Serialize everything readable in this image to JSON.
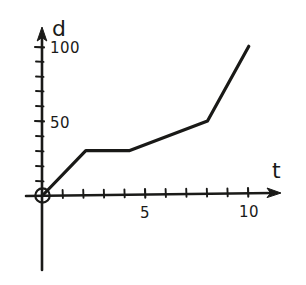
{
  "chart_data": {
    "type": "line",
    "title": "",
    "subtitle": "",
    "xlabel": "t",
    "ylabel": "d",
    "xlim": [
      0,
      11.2
    ],
    "ylim": [
      0,
      112
    ],
    "grid": false,
    "legend": "none",
    "style": "hand-drawn sketch, black ink on white paper",
    "x": [
      0,
      2.1,
      4.2,
      8.0,
      10.0
    ],
    "values": [
      0,
      30,
      30,
      50,
      100
    ],
    "points": [
      {
        "t": 0,
        "d": 0
      },
      {
        "t": 2.1,
        "d": 30
      },
      {
        "t": 4.2,
        "d": 30
      },
      {
        "t": 8.0,
        "d": 50
      },
      {
        "t": 10.0,
        "d": 100
      }
    ],
    "xticks": [
      1,
      2,
      3,
      4,
      5,
      6,
      7,
      8,
      9,
      10
    ],
    "xtick_labels": [
      "",
      "",
      "",
      "",
      "5",
      "",
      "",
      "",
      "",
      "10"
    ],
    "yticks": [
      10,
      20,
      30,
      40,
      50,
      60,
      70,
      80,
      90,
      100
    ],
    "ytick_labels": [
      "",
      "",
      "",
      "",
      "50",
      "",
      "",
      "",
      "",
      "100"
    ],
    "annotations": [
      {
        "name": "origin-marker",
        "t": 0,
        "d": 0,
        "shape": "circle"
      }
    ]
  },
  "axes": {
    "y_label": "d",
    "x_label": "t",
    "y_tick_100": "100",
    "y_tick_50": "50",
    "x_tick_5": "5",
    "x_tick_10": "10"
  },
  "colors": {
    "ink": "#1a1a18",
    "paper": "#ffffff",
    "curve": "#191917"
  }
}
